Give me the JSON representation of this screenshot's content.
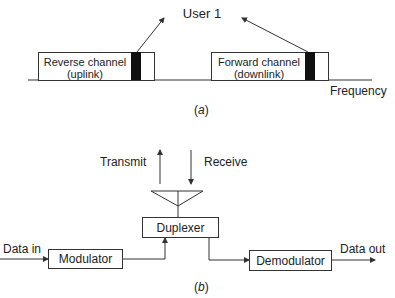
{
  "part_a": {
    "user_label": "User 1",
    "reverse_channel": {
      "line1": "Reverse channel",
      "line2": "(uplink)"
    },
    "forward_channel": {
      "line1": "Forward channel",
      "line2": "(downlink)"
    },
    "axis_label": "Frequency",
    "caption_open": "(",
    "caption_letter": "a",
    "caption_close": ")"
  },
  "part_b": {
    "transmit_label": "Transmit",
    "receive_label": "Receive",
    "duplexer_label": "Duplexer",
    "modulator_label": "Modulator",
    "demodulator_label": "Demodulator",
    "data_in_label": "Data in",
    "data_out_label": "Data out",
    "caption_open": "(",
    "caption_letter": "b",
    "caption_close": ")"
  }
}
